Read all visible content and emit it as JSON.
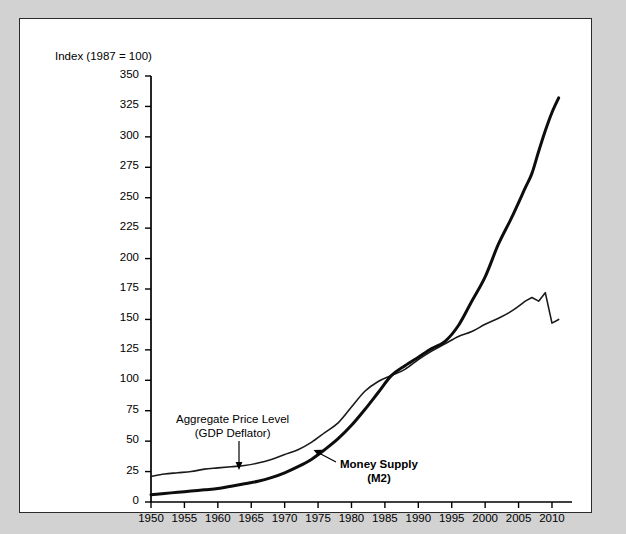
{
  "chart_data": {
    "type": "line",
    "title": "Index (1987 = 100)",
    "xlabel": "",
    "ylabel": "Index (1987 = 100)",
    "xlim": [
      1950,
      2011.5
    ],
    "ylim": [
      0,
      350
    ],
    "grid": false,
    "legend_position": "inline-annotations",
    "x_ticks": [
      1950,
      1955,
      1960,
      1965,
      1970,
      1975,
      1980,
      1985,
      1990,
      1995,
      2000,
      2005,
      2010
    ],
    "y_ticks": [
      0,
      25,
      50,
      75,
      100,
      125,
      150,
      175,
      200,
      225,
      250,
      275,
      300,
      325,
      350
    ],
    "x": [
      1950,
      1952,
      1954,
      1956,
      1958,
      1960,
      1962,
      1964,
      1966,
      1968,
      1970,
      1972,
      1974,
      1976,
      1978,
      1980,
      1982,
      1984,
      1986,
      1988,
      1990,
      1992,
      1994,
      1996,
      1998,
      2000,
      2002,
      2004,
      2006,
      2007,
      2008,
      2009,
      2010,
      2011
    ],
    "series": [
      {
        "name": "Aggregate Price Level (GDP Deflator)",
        "color": "#1a1a1a",
        "line_width": 1.6,
        "values": [
          21,
          23,
          24,
          25,
          27,
          28,
          29,
          30,
          32,
          35,
          39,
          43,
          49,
          57,
          65,
          78,
          91,
          99,
          104,
          109,
          117,
          124,
          130,
          136,
          140,
          146,
          151,
          157,
          165,
          168,
          165,
          172,
          147,
          150
        ]
      },
      {
        "name": "Money Supply (M2)",
        "color": "#0d0d0d",
        "line_width": 3.0,
        "values": [
          6,
          7,
          8,
          9,
          10,
          11,
          13,
          15,
          17,
          20,
          24,
          29,
          35,
          43,
          52,
          63,
          76,
          90,
          104,
          112,
          119,
          126,
          132,
          145,
          165,
          185,
          212,
          234,
          258,
          270,
          288,
          305,
          320,
          332
        ]
      }
    ],
    "annotations": [
      {
        "name": "aggregate-price-level",
        "line1": "Aggregate Price Level",
        "line2": "(GDP Deflator)",
        "bold": false,
        "arrow": "down"
      },
      {
        "name": "money-supply",
        "line1": "Money Supply",
        "line2": "(M2)",
        "bold": true,
        "arrow": "left"
      }
    ]
  },
  "colors": {
    "page_background": "#d2d2d2",
    "panel_background": "#ffffff",
    "panel_border": "#2b2b2b",
    "axis": "#000000",
    "text": "#000000"
  }
}
